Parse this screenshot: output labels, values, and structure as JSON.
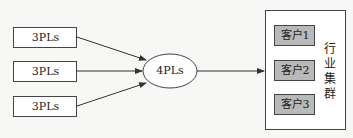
{
  "diagram": {
    "sources": [
      {
        "label": "3PLs"
      },
      {
        "label": "3PLs"
      },
      {
        "label": "3PLs"
      }
    ],
    "hub": {
      "label": "4PLs"
    },
    "cluster": {
      "label": "行业集群",
      "label_chars": [
        "行",
        "业",
        "集",
        "群"
      ],
      "customers": [
        {
          "label": "客户1"
        },
        {
          "label": "客户2"
        },
        {
          "label": "客户3"
        }
      ]
    },
    "colors": {
      "line": "#333333",
      "customer_fill": "#b9b9b9",
      "background": "#f7f7f5"
    }
  }
}
